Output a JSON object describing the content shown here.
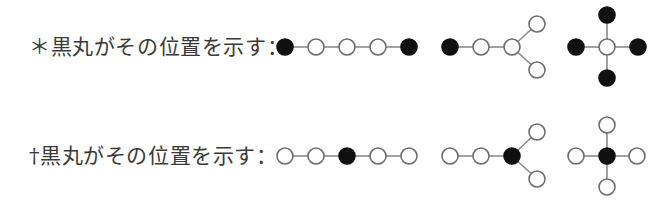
{
  "legend": [
    {
      "symbol": "＊",
      "text": "黒丸がその位置を示す：",
      "label": "＊黒丸がその位置を示す：",
      "center_y": 47,
      "structures": [
        {
          "name": "linear-chain-terminal-positions",
          "description": "5-atom linear chain, both terminal atoms filled",
          "atoms": [
            {
              "x": 285,
              "y": 47,
              "filled": true
            },
            {
              "x": 316,
              "y": 47,
              "filled": false
            },
            {
              "x": 347,
              "y": 47,
              "filled": false
            },
            {
              "x": 378,
              "y": 47,
              "filled": false
            },
            {
              "x": 409,
              "y": 47,
              "filled": true
            }
          ],
          "bonds": [
            [
              0,
              1
            ],
            [
              1,
              2
            ],
            [
              2,
              3
            ],
            [
              3,
              4
            ]
          ]
        },
        {
          "name": "branched-chain-terminal-positions",
          "description": "Y-branched chain, only first terminal atom filled",
          "atoms": [
            {
              "x": 450,
              "y": 47,
              "filled": true
            },
            {
              "x": 481,
              "y": 47,
              "filled": false
            },
            {
              "x": 512,
              "y": 47,
              "filled": false
            },
            {
              "x": 537,
              "y": 24,
              "filled": false
            },
            {
              "x": 537,
              "y": 70,
              "filled": false
            }
          ],
          "bonds": [
            [
              0,
              1
            ],
            [
              1,
              2
            ],
            [
              2,
              3
            ],
            [
              2,
              4
            ]
          ]
        },
        {
          "name": "cross-terminal-positions",
          "description": "Cross shape, center open, four terminals filled",
          "atoms": [
            {
              "x": 607,
              "y": 47,
              "filled": false
            },
            {
              "x": 576,
              "y": 47,
              "filled": true
            },
            {
              "x": 638,
              "y": 47,
              "filled": true
            },
            {
              "x": 607,
              "y": 15,
              "filled": true
            },
            {
              "x": 607,
              "y": 78,
              "filled": true
            }
          ],
          "bonds": [
            [
              0,
              1
            ],
            [
              0,
              2
            ],
            [
              0,
              3
            ],
            [
              0,
              4
            ]
          ]
        }
      ]
    },
    {
      "symbol": "†",
      "text": "黒丸がその位置を示す：",
      "label": "†黒丸がその位置を示す：",
      "center_y": 156,
      "structures": [
        {
          "name": "linear-chain-central-position",
          "description": "5-atom linear chain, middle atom filled",
          "atoms": [
            {
              "x": 285,
              "y": 156,
              "filled": false
            },
            {
              "x": 316,
              "y": 156,
              "filled": false
            },
            {
              "x": 347,
              "y": 156,
              "filled": true
            },
            {
              "x": 378,
              "y": 156,
              "filled": false
            },
            {
              "x": 409,
              "y": 156,
              "filled": false
            }
          ],
          "bonds": [
            [
              0,
              1
            ],
            [
              1,
              2
            ],
            [
              2,
              3
            ],
            [
              3,
              4
            ]
          ]
        },
        {
          "name": "branched-chain-branch-point",
          "description": "Y-branched chain, branch-point atom filled",
          "atoms": [
            {
              "x": 450,
              "y": 156,
              "filled": false
            },
            {
              "x": 481,
              "y": 156,
              "filled": false
            },
            {
              "x": 512,
              "y": 156,
              "filled": true
            },
            {
              "x": 537,
              "y": 132,
              "filled": false
            },
            {
              "x": 537,
              "y": 179,
              "filled": false
            }
          ],
          "bonds": [
            [
              0,
              1
            ],
            [
              1,
              2
            ],
            [
              2,
              3
            ],
            [
              2,
              4
            ]
          ]
        },
        {
          "name": "cross-central-position",
          "description": "Cross shape, center filled, four terminals open",
          "atoms": [
            {
              "x": 607,
              "y": 156,
              "filled": true
            },
            {
              "x": 576,
              "y": 156,
              "filled": false
            },
            {
              "x": 637,
              "y": 156,
              "filled": false
            },
            {
              "x": 607,
              "y": 125,
              "filled": false
            },
            {
              "x": 607,
              "y": 187,
              "filled": false
            }
          ],
          "bonds": [
            [
              0,
              1
            ],
            [
              0,
              2
            ],
            [
              0,
              3
            ],
            [
              0,
              4
            ]
          ]
        }
      ]
    }
  ],
  "style": {
    "atom_radius": 8,
    "filled_color": "#111111",
    "open_stroke": "#6e6e6e",
    "bond_color": "#8a8a8a",
    "text_color": "#3a3a3a",
    "background": "#ffffff"
  }
}
